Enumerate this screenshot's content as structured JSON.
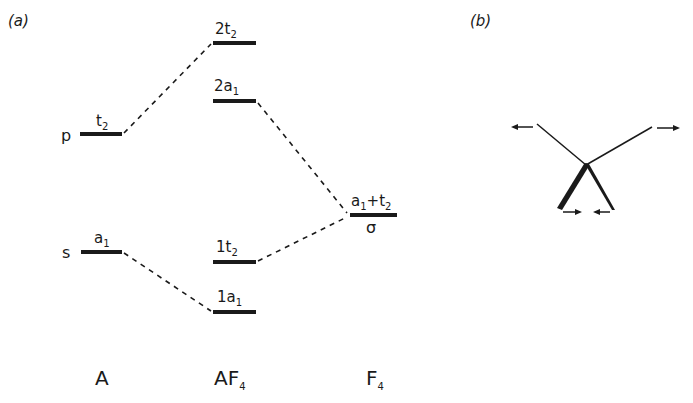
{
  "figure": {
    "panel_a": {
      "label": "(a)",
      "columns": [
        {
          "id": "A",
          "label": "A",
          "subscript": ""
        },
        {
          "id": "AF4",
          "label": "AF",
          "subscript": "4"
        },
        {
          "id": "F4",
          "label": "F",
          "subscript": "4"
        }
      ],
      "atom_levels": [
        {
          "orbital": "p",
          "symmetry": "t",
          "symmetry_sub": "2"
        },
        {
          "orbital": "s",
          "symmetry": "a",
          "symmetry_sub": "1"
        }
      ],
      "molecular_levels": [
        {
          "name": "2t",
          "sub": "2"
        },
        {
          "name": "2a",
          "sub": "1"
        },
        {
          "name": "1t",
          "sub": "2"
        },
        {
          "name": "1a",
          "sub": "1"
        }
      ],
      "ligand_level": {
        "symmetry_a": "a",
        "symmetry_a_sub": "1",
        "plus": "+",
        "symmetry_t": "t",
        "symmetry_t_sub": "2",
        "orbital": "σ"
      },
      "correlations": [
        {
          "from": "A.p",
          "to": "AF4.2t2"
        },
        {
          "from": "A.s",
          "to": "AF4.1a1"
        },
        {
          "from": "AF4.2a1",
          "to": "F4.sigma"
        },
        {
          "from": "AF4.1t2",
          "to": "F4.sigma"
        }
      ]
    },
    "panel_b": {
      "label": "(b)",
      "description": "Distortion of tetrahedral AF4 with arrows showing atomic displacements"
    },
    "colors": {
      "ink": "#1a1a1a",
      "background": "#ffffff"
    }
  }
}
